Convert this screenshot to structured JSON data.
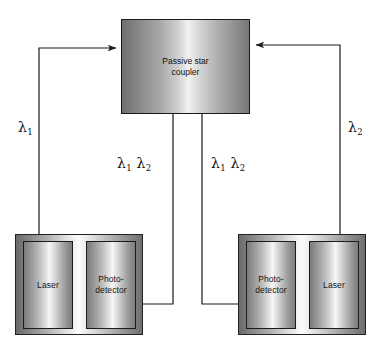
{
  "diagram": {
    "type": "block-diagram",
    "colors": {
      "line": "#1a1a1a",
      "box_border": "#1a1a1a",
      "background": "#ffffff",
      "label_text": "#101010"
    }
  },
  "coupler": {
    "label": "Passive star\ncoupler",
    "name": "passive-star-coupler"
  },
  "nodes": [
    {
      "id": "left-node",
      "components": [
        {
          "id": "left-laser",
          "label": "Laser"
        },
        {
          "id": "left-photodetector",
          "label": "Photo-\ndetector"
        }
      ]
    },
    {
      "id": "right-node",
      "components": [
        {
          "id": "right-photodetector",
          "label": "Photo-\ndetector"
        },
        {
          "id": "right-laser",
          "label": "Laser"
        }
      ]
    }
  ],
  "wavelength_labels": [
    {
      "id": "lambda-1-left",
      "symbol": "λ",
      "sub": "1"
    },
    {
      "id": "lambda-2-right",
      "symbol": "λ",
      "sub": "2"
    },
    {
      "id": "lambda-12-left",
      "symbol": "λ",
      "sub": "1",
      "symbol2": "λ",
      "sub2": "2"
    },
    {
      "id": "lambda-12-right",
      "symbol": "λ",
      "sub": "1",
      "symbol2": "λ",
      "sub2": "2"
    }
  ],
  "connections": [
    {
      "id": "left-laser-to-coupler",
      "from": "left-laser",
      "to": "passive-star-coupler",
      "carries": "λ1",
      "direction": "up-then-right"
    },
    {
      "id": "right-laser-to-coupler",
      "from": "right-laser",
      "to": "passive-star-coupler",
      "carries": "λ2",
      "direction": "up-then-left"
    },
    {
      "id": "coupler-to-left-photodetector",
      "from": "passive-star-coupler",
      "to": "left-photodetector",
      "carries": "λ1 λ2",
      "direction": "down-then-left"
    },
    {
      "id": "coupler-to-right-photodetector",
      "from": "passive-star-coupler",
      "to": "right-photodetector",
      "carries": "λ1 λ2",
      "direction": "down-then-right"
    }
  ]
}
